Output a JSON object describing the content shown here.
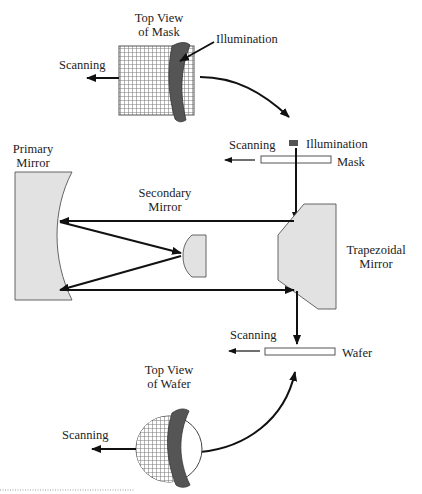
{
  "diagram": {
    "type": "optical-schematic",
    "colors": {
      "mirror_fill": "#e2e2e2",
      "stroke": "#111111",
      "illumination_slit": "#555555",
      "mesh": "#7a7a7a"
    },
    "mask_top_view": {
      "title_line1": "Top View",
      "title_line2": "of Mask",
      "illumination_label": "Illumination",
      "scanning_label": "Scanning"
    },
    "mask_side": {
      "scanning_label": "Scanning",
      "illumination_label": "Illumination",
      "mask_label": "Mask"
    },
    "primary_mirror": {
      "label_line1": "Primary",
      "label_line2": "Mirror"
    },
    "secondary_mirror": {
      "label_line1": "Secondary",
      "label_line2": "Mirror"
    },
    "trapezoidal_mirror": {
      "label_line1": "Trapezoidal",
      "label_line2": "Mirror"
    },
    "wafer_side": {
      "scanning_label": "Scanning",
      "wafer_label": "Wafer"
    },
    "wafer_top_view": {
      "title_line1": "Top View",
      "title_line2": "of Wafer",
      "scanning_label": "Scanning"
    }
  }
}
